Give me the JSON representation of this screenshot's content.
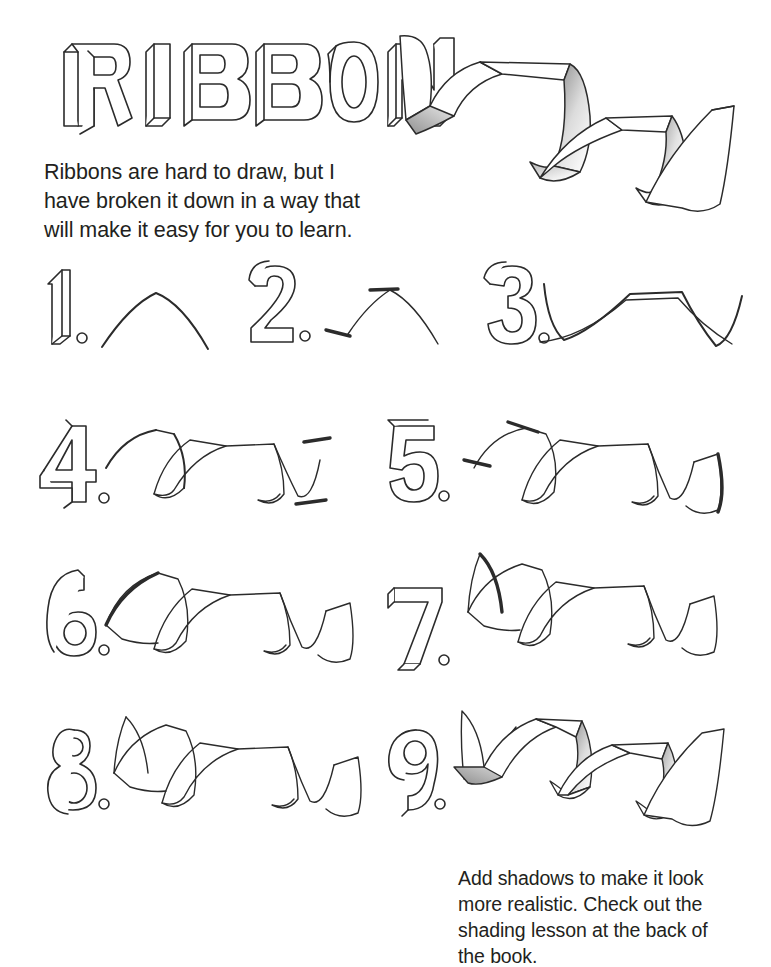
{
  "document": {
    "title": "RIBBON",
    "intro_text": "Ribbons are hard to draw, but I\nhave broken it down in a way that\nwill make it easy for you to learn.",
    "closing_caption": "Add shadows to make it look\nmore realistic. Check out the\nshading lesson at the back of\nthe book.",
    "ink_color": "#2b2b2b",
    "text_color": "#231f20",
    "paper_color": "#ffffff",
    "shade_dark": "#8f8f8f",
    "shade_light": "#ffffff"
  },
  "hero": {
    "label": "finished-shaded-ribbon",
    "description": "Completed ribbon with curled tail and graphite shading"
  },
  "steps": [
    {
      "number": "1.",
      "stage": "single-arch-line",
      "description": "Draw one simple arch / hump curve."
    },
    {
      "number": "2.",
      "stage": "arch-with-end-ticks",
      "description": "Add short flat tick marks at the start and at the peak."
    },
    {
      "number": "3.",
      "stage": "double-wave-edges",
      "description": "Draw the second wavy edge line crossing the first."
    },
    {
      "number": "4.",
      "stage": "full-band-with-twists",
      "description": "Connect the edges into a twisting band."
    },
    {
      "number": "5.",
      "stage": "band-with-right-curl",
      "description": "Curl and close the right-hand end of the ribbon."
    },
    {
      "number": "6.",
      "stage": "band-with-left-flap",
      "description": "Add the flat flap on the left-hand end."
    },
    {
      "number": "7.",
      "stage": "band-with-curled-tail",
      "description": "Add the curled tail rising from the left end."
    },
    {
      "number": "8.",
      "stage": "clean-outline-complete",
      "description": "Clean up the lines for the finished outline."
    },
    {
      "number": "9.",
      "stage": "shaded-complete",
      "description": "Add shadows to the twisted faces."
    }
  ]
}
